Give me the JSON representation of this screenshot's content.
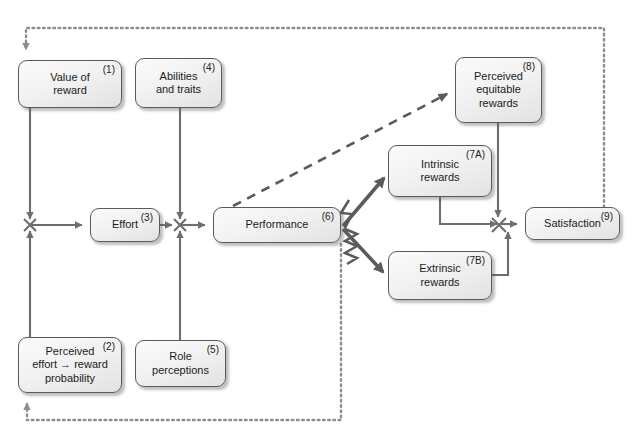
{
  "diagram": {
    "background": "#ffffff",
    "box_fill": "#f0f0f0",
    "box_border": "#5a5a5a",
    "solid_line_color": "#6e6e6e",
    "dotted_line_color": "#8d8d8d",
    "dashed_line_color": "#5a5a5a",
    "thick_arrow_color": "#5c5c5c"
  },
  "nodes": [
    {
      "id": "n1",
      "number": "(1)",
      "label": "Value of\nreward",
      "x": 18,
      "y": 60,
      "w": 104,
      "h": 48
    },
    {
      "id": "n4",
      "number": "(4)",
      "label": "Abilities\nand traits",
      "x": 135,
      "y": 58,
      "w": 87,
      "h": 50
    },
    {
      "id": "n8",
      "number": "(8)",
      "label": "Perceived\nequitable\nrewards",
      "x": 455,
      "y": 57,
      "w": 87,
      "h": 66
    },
    {
      "id": "n7a",
      "number": "(7A)",
      "label": "Intrinsic\nrewards",
      "x": 388,
      "y": 145,
      "w": 104,
      "h": 52
    },
    {
      "id": "n3",
      "number": "(3)",
      "label": "Effort",
      "x": 90,
      "y": 208,
      "w": 70,
      "h": 34
    },
    {
      "id": "n6",
      "number": "(6)",
      "label": "Performance",
      "x": 213,
      "y": 207,
      "w": 128,
      "h": 36
    },
    {
      "id": "n9",
      "number": "(9)",
      "label": "Satisfaction",
      "x": 525,
      "y": 207,
      "w": 95,
      "h": 33
    },
    {
      "id": "n7b",
      "number": "(7B)",
      "label": "Extrinsic\nrewards",
      "x": 388,
      "y": 251,
      "w": 104,
      "h": 49
    },
    {
      "id": "n2",
      "number": "(2)",
      "label": "Perceived\neffort → reward\nprobability",
      "x": 18,
      "y": 337,
      "w": 104,
      "h": 56
    },
    {
      "id": "n5",
      "number": "(5)",
      "label": "Role\nperceptions",
      "x": 135,
      "y": 340,
      "w": 91,
      "h": 47
    }
  ],
  "connections": [
    {
      "name": "value-of-reward-to-effort-junction",
      "style": "solid"
    },
    {
      "name": "perceived-probability-to-effort-junction",
      "style": "solid"
    },
    {
      "name": "effort-junction-to-effort",
      "style": "solid"
    },
    {
      "name": "effort-to-performance-junction",
      "style": "solid"
    },
    {
      "name": "abilities-to-performance-junction",
      "style": "solid"
    },
    {
      "name": "role-perceptions-to-performance-junction",
      "style": "solid"
    },
    {
      "name": "performance-junction-to-performance",
      "style": "solid"
    },
    {
      "name": "performance-to-perceived-equitable",
      "style": "dashed"
    },
    {
      "name": "performance-to-intrinsic-rewards",
      "style": "thick-wavy"
    },
    {
      "name": "performance-to-extrinsic-rewards",
      "style": "thick-wavy"
    },
    {
      "name": "intrinsic-rewards-to-satisfaction-junction",
      "style": "solid"
    },
    {
      "name": "extrinsic-rewards-to-satisfaction-junction",
      "style": "solid"
    },
    {
      "name": "perceived-equitable-to-satisfaction-junction",
      "style": "solid"
    },
    {
      "name": "satisfaction-junction-to-satisfaction",
      "style": "solid"
    },
    {
      "name": "satisfaction-feedback-to-value-of-reward",
      "style": "dotted"
    },
    {
      "name": "performance-feedback-to-perceived-probability",
      "style": "dotted"
    }
  ]
}
